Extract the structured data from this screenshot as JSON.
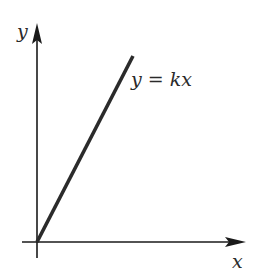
{
  "diagram": {
    "title": "",
    "axes": {
      "x_label": "x",
      "y_label": "y"
    },
    "line": {
      "equation_label": "y = kx",
      "description": "straight line through origin with positive slope"
    },
    "colors": {
      "axis": "#1a1a1a",
      "line": "#2b2b2b",
      "text": "#2a2a2a",
      "background": "#ffffff"
    }
  }
}
